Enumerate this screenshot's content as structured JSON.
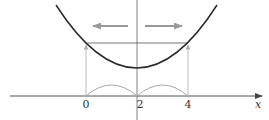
{
  "diagram": {
    "type": "parabola-symmetry",
    "axis": {
      "label": "x",
      "ticks": [
        {
          "value": 0,
          "label": "0"
        },
        {
          "value": 2,
          "label": "2"
        },
        {
          "value": 4,
          "label": "4"
        }
      ]
    },
    "axis_of_symmetry": 2,
    "equal_height_points": [
      0,
      4
    ],
    "arrows": {
      "left": "left-arrow",
      "right": "right-arrow"
    },
    "colors": {
      "curve": "#2a2a2a",
      "axis": "#555555",
      "guides": "#a8a8a8",
      "arrows": "#999999",
      "text": "#333333"
    }
  }
}
